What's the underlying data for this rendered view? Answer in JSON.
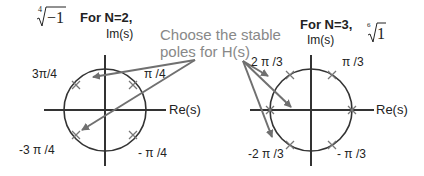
{
  "annotation": {
    "line1": "Choose the stable",
    "line2": "poles for H(s)",
    "color": "#888888"
  },
  "left_plot": {
    "title": "For N=2,",
    "root_expr": {
      "index": "4",
      "radicand": "−1"
    },
    "y_axis_label": "Im(s)",
    "x_axis_label": "Re(s)",
    "pole_labels": {
      "q1": "π /4",
      "q2": "3π/4",
      "q3": "-3 π /4",
      "q4": "- π /4"
    }
  },
  "right_plot": {
    "title": "For N=3,",
    "root_expr": {
      "index": "6",
      "radicand": "1"
    },
    "y_axis_label": "Im(s)",
    "x_axis_label": "Re(s)",
    "pole_labels": {
      "q1": "π /3",
      "q2": "2 π /3",
      "q3": "-2 π /3",
      "q4": "- π /3"
    }
  },
  "colors": {
    "axis": "#333333",
    "circle": "#333333",
    "arrow": "#707070",
    "pole": "#707070"
  }
}
